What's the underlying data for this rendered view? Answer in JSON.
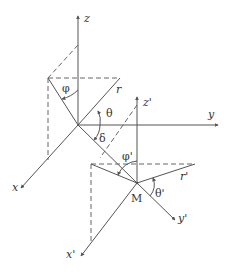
{
  "figure": {
    "labels": {
      "z": "z",
      "y": "y",
      "x": "x",
      "r": "r",
      "phi": "φ",
      "theta": "θ",
      "delta": "δ",
      "z_prime": "z'",
      "y_prime": "y'",
      "x_prime": "x'",
      "r_prime": "r'",
      "phi_prime": "φ'",
      "theta_prime": "θ'",
      "M": "M"
    },
    "colors": {
      "line": "#555555",
      "text": "#333333",
      "background": "#ffffff"
    }
  }
}
